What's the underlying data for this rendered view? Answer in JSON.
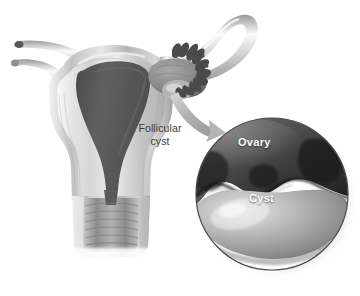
{
  "figure": {
    "background_color": "#ffffff",
    "width": 360,
    "height": 296,
    "style": "grayscale medical illustration"
  },
  "annotations": {
    "follicular_cyst_label": "Follicular\ncyst",
    "follicular_cyst_label_color": "#3a3a3a",
    "ovary_label": "Ovary",
    "cyst_label": "Cyst",
    "inset_label_color": "#ffffff"
  },
  "anatomy": {
    "uterus": {
      "name": "uterus",
      "cavity_color": "#5b5b5b",
      "wall_color": "#b8b8b8",
      "outline_color": "#6e6e6e"
    },
    "cervix": {
      "name": "cervix",
      "canal_color": "#8e8e8e"
    },
    "fallopian_tube_left": {
      "name": "left-fallopian-tube",
      "color": "#c9c9c9"
    },
    "fallopian_tube_right": {
      "name": "right-fallopian-tube",
      "color": "#cfcfcf"
    },
    "round_ligament_left": {
      "name": "left-round-ligament",
      "color": "#c4c4c4"
    },
    "ovary_right": {
      "name": "right-ovary",
      "color": "#8a8a8a"
    },
    "fimbriae": {
      "name": "fimbriae",
      "color": "#4a4a4a"
    }
  },
  "inset": {
    "name": "magnified-ovary-inset",
    "shape": "circle",
    "center_x": 272,
    "center_y": 194,
    "radius": 76,
    "border_color": "#4a4a4a",
    "ovary_color": "#4d4d4d",
    "cyst_color": "#a8a8a8",
    "background_color": "#ffffff"
  },
  "pointer": {
    "name": "callout-arrow",
    "color": "#b0b0b0",
    "direction": "from ovary down-right into magnified inset"
  }
}
